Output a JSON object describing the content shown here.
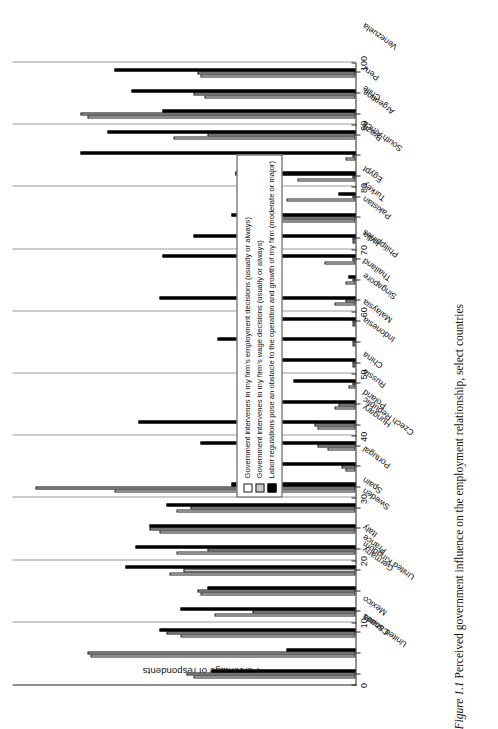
{
  "caption": {
    "number": "Figure 1.1",
    "text": "Perceived government influence on the employment relationship, select countries"
  },
  "chart_data": {
    "type": "bar",
    "title": "Perceived government influence on the employment relationship, select countries",
    "xlabel": "",
    "ylabel": "Percentage of respondents",
    "ylim": [
      0,
      100
    ],
    "yticks": [
      0,
      10,
      20,
      30,
      40,
      50,
      60,
      70,
      80,
      90,
      100
    ],
    "grid": true,
    "orientation": "vertical",
    "legend_position": "inside-right",
    "categories": [
      "United States",
      "Canada",
      "Mexico",
      "United Kingdom",
      "Germany",
      "France",
      "Italy",
      "Sweden",
      "Spain",
      "Portugal",
      "Czech Republic",
      "Hungary",
      "Poland",
      "Russia",
      "China",
      "Indonesia",
      "Malaysia",
      "Singapore",
      "Thailand",
      "Philippines",
      "India",
      "Pakistan",
      "Turkey",
      "Egypt",
      "South Africa",
      "Brazil",
      "Argentina",
      "Chile",
      "Peru",
      "Venezuela"
    ],
    "series": [
      {
        "name": "Government intervenes in my firm's employment decisions (usually or always)",
        "color": "#ffffff",
        "values": [
          47,
          77,
          51,
          41,
          45,
          54,
          52,
          57,
          52,
          70,
          3,
          8,
          11,
          6,
          2,
          1,
          1,
          1,
          6,
          3,
          9,
          1,
          25,
          20,
          17,
          3,
          53,
          78,
          44,
          45
        ]
      },
      {
        "name": "Government intervenes in my firm's wage decisions (usually or always)",
        "color": "#c9c9c9",
        "values": [
          49,
          78,
          55,
          30,
          46,
          50,
          43,
          60,
          48,
          93,
          4,
          11,
          12,
          5,
          1,
          1,
          1,
          1,
          3,
          1,
          1,
          1,
          22,
          1,
          1,
          1,
          43,
          80,
          47,
          46
        ]
      },
      {
        "name": "Labor regulations pose an obstacle to the operation and growth of my firm (moderate or major)",
        "color": "#000000",
        "values": [
          42,
          20,
          57,
          51,
          43,
          67,
          64,
          60,
          55,
          36,
          30,
          45,
          63,
          34,
          18,
          30,
          40,
          26,
          57,
          2,
          56,
          47,
          36,
          5,
          35,
          80,
          72,
          56,
          65,
          70
        ]
      }
    ]
  }
}
